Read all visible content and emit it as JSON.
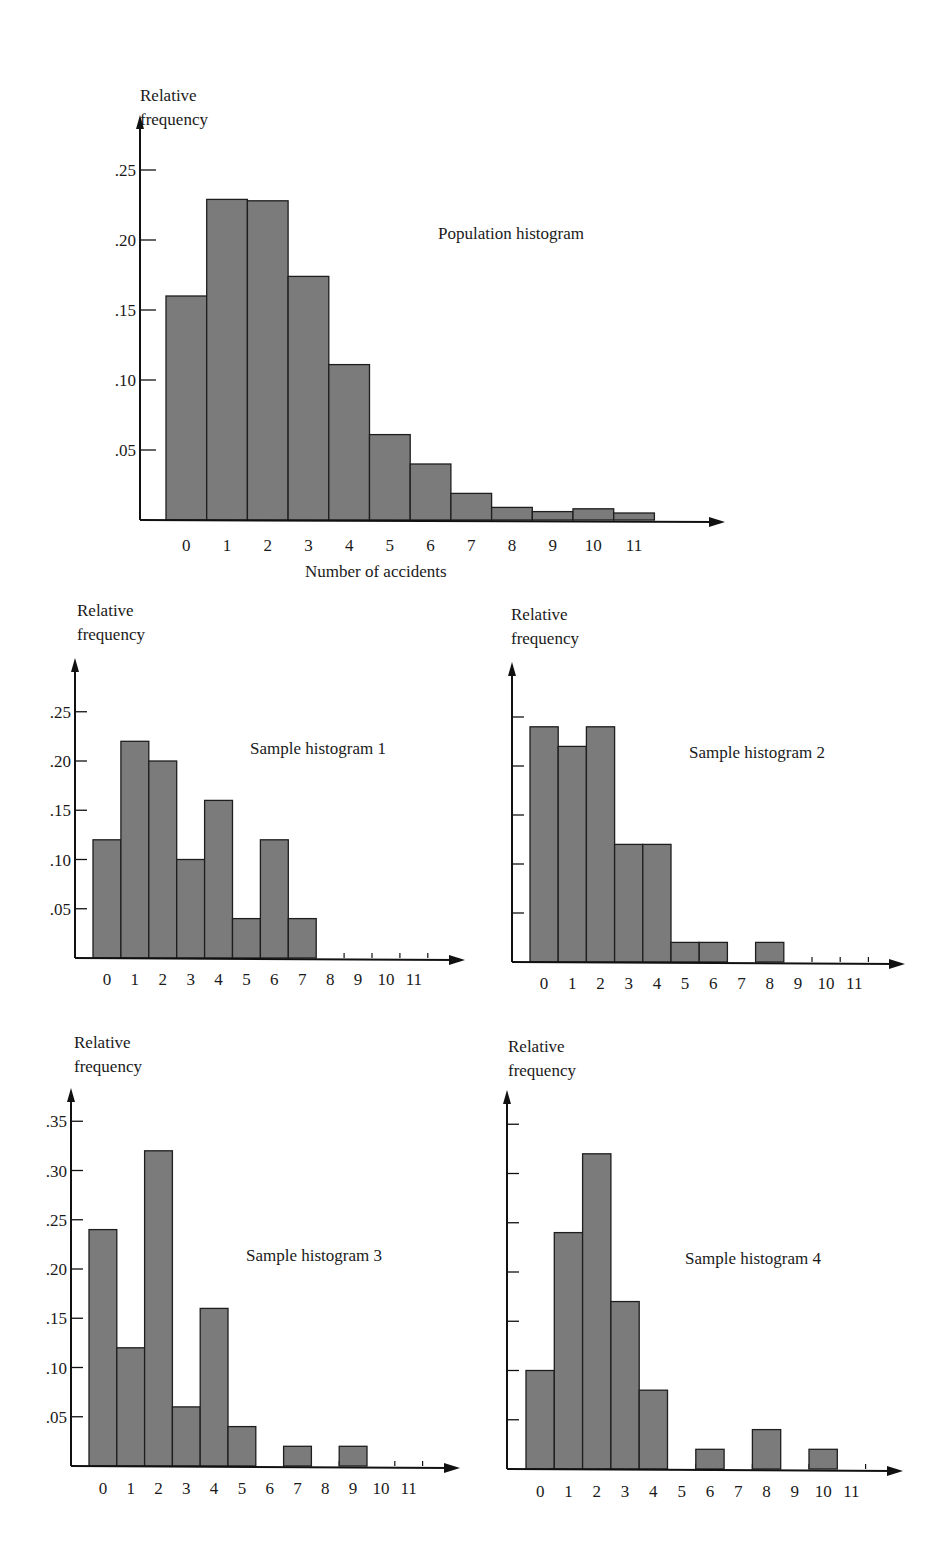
{
  "colors": {
    "bar_fill": "#7b7b7b",
    "bar_stroke": "#1e1e1e",
    "axis": "#111111"
  },
  "chart_data": [
    {
      "id": "population",
      "type": "bar",
      "title": "Population histogram",
      "xlabel": "Number of accidents",
      "ylabel": "Relative frequency",
      "ylabel_lines": [
        "Relative",
        "frequency"
      ],
      "categories": [
        "0",
        "1",
        "2",
        "3",
        "4",
        "5",
        "6",
        "7",
        "8",
        "9",
        "10",
        "11"
      ],
      "values": [
        0.16,
        0.229,
        0.228,
        0.174,
        0.111,
        0.061,
        0.04,
        0.019,
        0.009,
        0.006,
        0.008,
        0.005
      ],
      "yticks": [
        0.05,
        0.1,
        0.15,
        0.2,
        0.25
      ],
      "ytick_labels": [
        ".05",
        ".10",
        ".15",
        ".20",
        ".25"
      ],
      "ylim": [
        0,
        0.28
      ],
      "grid": false,
      "legend": null
    },
    {
      "id": "sample1",
      "type": "bar",
      "title": "Sample histogram 1",
      "xlabel": "",
      "ylabel": "Relative frequency",
      "ylabel_lines": [
        "Relative",
        "frequency"
      ],
      "categories": [
        "0",
        "1",
        "2",
        "3",
        "4",
        "5",
        "6",
        "7",
        "8",
        "9",
        "10",
        "11"
      ],
      "values": [
        0.12,
        0.22,
        0.2,
        0.1,
        0.16,
        0.04,
        0.12,
        0.04,
        0,
        0,
        0,
        0
      ],
      "yticks": [
        0.05,
        0.1,
        0.15,
        0.2,
        0.25
      ],
      "ytick_labels": [
        ".05",
        ".10",
        ".15",
        ".20",
        ".25"
      ],
      "ylim": [
        0,
        0.29
      ],
      "grid": false,
      "legend": null
    },
    {
      "id": "sample2",
      "type": "bar",
      "title": "Sample histogram 2",
      "xlabel": "",
      "ylabel": "Relative frequency",
      "ylabel_lines": [
        "Relative",
        "frequency"
      ],
      "categories": [
        "0",
        "1",
        "2",
        "3",
        "4",
        "5",
        "6",
        "7",
        "8",
        "9",
        "10",
        "11"
      ],
      "values": [
        0.24,
        0.22,
        0.24,
        0.12,
        0.12,
        0.02,
        0.02,
        0,
        0.02,
        0,
        0,
        0
      ],
      "yticks": [
        0.05,
        0.1,
        0.15,
        0.2,
        0.25
      ],
      "ytick_labels": [
        "",
        "",
        "",
        "",
        ""
      ],
      "ylim": [
        0,
        0.29
      ],
      "grid": false,
      "legend": null
    },
    {
      "id": "sample3",
      "type": "bar",
      "title": "Sample histogram 3",
      "xlabel": "",
      "ylabel": "Relative frequency",
      "ylabel_lines": [
        "Relative",
        "frequency"
      ],
      "categories": [
        "0",
        "1",
        "2",
        "3",
        "4",
        "5",
        "6",
        "7",
        "8",
        "9",
        "10",
        "11"
      ],
      "values": [
        0.24,
        0.12,
        0.32,
        0.06,
        0.16,
        0.04,
        0,
        0.02,
        0,
        0.02,
        0,
        0
      ],
      "yticks": [
        0.05,
        0.1,
        0.15,
        0.2,
        0.25,
        0.3,
        0.35
      ],
      "ytick_labels": [
        ".05",
        ".10",
        ".15",
        ".20",
        ".25",
        ".30",
        ".35"
      ],
      "ylim": [
        0,
        0.38
      ],
      "grid": false,
      "legend": null
    },
    {
      "id": "sample4",
      "type": "bar",
      "title": "Sample histogram 4",
      "xlabel": "",
      "ylabel": "Relative frequency",
      "ylabel_lines": [
        "Relative",
        "frequency"
      ],
      "categories": [
        "0",
        "1",
        "2",
        "3",
        "4",
        "5",
        "6",
        "7",
        "8",
        "9",
        "10",
        "11"
      ],
      "values": [
        0.1,
        0.24,
        0.32,
        0.17,
        0.08,
        0,
        0.02,
        0,
        0.04,
        0,
        0.02,
        0
      ],
      "yticks": [
        0.05,
        0.1,
        0.15,
        0.2,
        0.25,
        0.3,
        0.35
      ],
      "ytick_labels": [
        "",
        "",
        "",
        "",
        "",
        "",
        ""
      ],
      "ylim": [
        0,
        0.38
      ],
      "grid": false,
      "legend": null
    }
  ]
}
